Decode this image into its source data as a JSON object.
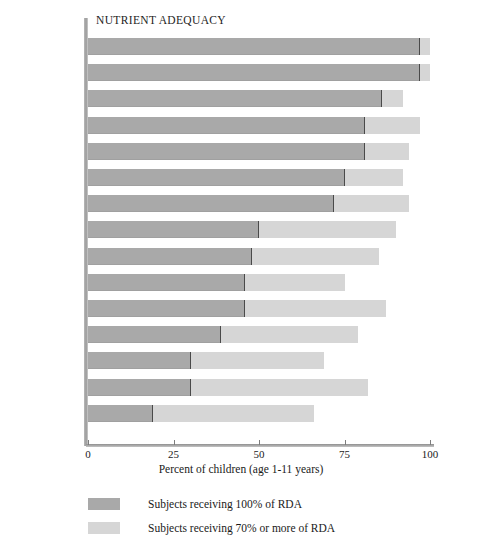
{
  "chart_data": {
    "type": "bar",
    "orientation": "horizontal",
    "stacked": true,
    "title": "NUTRIENT ADEQUACY",
    "xlabel": "Percent of children (age 1-11 years)",
    "ylabel": "",
    "xlim": [
      0,
      100
    ],
    "xticks": [
      0,
      25,
      50,
      75,
      100
    ],
    "grid": false,
    "legend_position": "bottom-left",
    "categories": [
      "Protein",
      "Riboflavin",
      "Vitamin C",
      "Vitamin B12",
      "Thiamin",
      "Niacin",
      "Vitamin A",
      "Calcium",
      "Magnesium",
      "Vitamin B6",
      "Iron",
      "Folacin",
      "Vitamin E",
      "Energy",
      "Zinc"
    ],
    "series": [
      {
        "name": "Subjects receiving 100% of RDA",
        "color": "#a9a9a9",
        "values": [
          97,
          97,
          86,
          81,
          81,
          75,
          72,
          50,
          48,
          46,
          46,
          39,
          30,
          30,
          19
        ]
      },
      {
        "name": "Subjects receiving 70% or more of RDA",
        "color": "#d6d6d6",
        "values": [
          100,
          100,
          92,
          97,
          94,
          92,
          94,
          90,
          85,
          75,
          87,
          79,
          69,
          82,
          66
        ]
      }
    ]
  },
  "rows": [
    {
      "label": "Protein",
      "sub": "",
      "muted": true,
      "full": 97,
      "partial": 100
    },
    {
      "label": "Riboflavin",
      "sub": "",
      "muted": false,
      "full": 97,
      "partial": 100
    },
    {
      "label": "Vitamin C",
      "sub": "",
      "muted": false,
      "full": 86,
      "partial": 92
    },
    {
      "label": "Vitamin B",
      "sub": "12",
      "muted": false,
      "full": 81,
      "partial": 97
    },
    {
      "label": "Thiamin",
      "sub": "",
      "muted": false,
      "full": 81,
      "partial": 94
    },
    {
      "label": "Niacin",
      "sub": "",
      "muted": false,
      "full": 75,
      "partial": 92
    },
    {
      "label": "Vitamin A",
      "sub": "",
      "muted": false,
      "full": 72,
      "partial": 94
    },
    {
      "label": "Calcium",
      "sub": "",
      "muted": false,
      "full": 50,
      "partial": 90
    },
    {
      "label": "Magnesium",
      "sub": "",
      "muted": false,
      "full": 48,
      "partial": 85
    },
    {
      "label": "Vitamin B",
      "sub": "6",
      "muted": false,
      "full": 46,
      "partial": 75
    },
    {
      "label": "Iron",
      "sub": "",
      "muted": false,
      "full": 46,
      "partial": 87
    },
    {
      "label": "Folacin",
      "sub": "",
      "muted": false,
      "full": 39,
      "partial": 79
    },
    {
      "label": "Vitamin E",
      "sub": "",
      "muted": false,
      "full": 30,
      "partial": 69
    },
    {
      "label": "Energy",
      "sub": "",
      "muted": true,
      "full": 30,
      "partial": 82
    },
    {
      "label": "Zinc",
      "sub": "",
      "muted": false,
      "full": 19,
      "partial": 66
    }
  ],
  "axis": {
    "title": "Percent of children (age 1-11 years)",
    "ticks": [
      "0",
      "25",
      "50",
      "75",
      "100"
    ]
  },
  "legend": {
    "items": [
      {
        "label": "Subjects receiving 100% of RDA",
        "color": "#a9a9a9"
      },
      {
        "label": "Subjects receiving 70% or more of RDA",
        "color": "#d6d6d6"
      }
    ]
  }
}
